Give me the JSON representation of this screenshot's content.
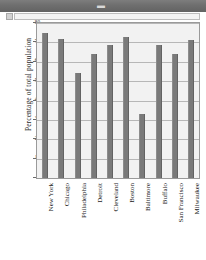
{
  "window": {
    "titlebar_glyph": "▬",
    "scrollbar_button_icon": "scroll-left-icon"
  },
  "chart_data": {
    "type": "bar",
    "title": "",
    "xlabel": "",
    "ylabel": "Percentage of total population",
    "categories": [
      "New York",
      "Chicago",
      "Philadelphia",
      "Detroit",
      "Cleveland",
      "Boston",
      "Baltimore",
      "Buffalo",
      "San Francisco",
      "Milwaukee"
    ],
    "values": [
      75,
      72,
      54,
      64,
      68.5,
      73,
      33,
      68.5,
      64,
      71
    ],
    "ylim": [
      0,
      80
    ],
    "yticks": [
      0,
      10,
      20,
      30,
      40,
      50,
      60,
      70,
      80
    ],
    "ytick_labels": [
      "0",
      "10",
      "20",
      "30",
      "40",
      "50",
      "60",
      "70",
      "80"
    ],
    "grid": true,
    "legend": "none",
    "bar_color": "#7a7a7a",
    "plot_background": "#f2f2f2",
    "frame_color": "#9a9a9a",
    "gridline_color": "#b7b7b7"
  }
}
